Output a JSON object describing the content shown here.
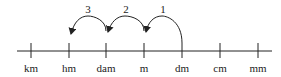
{
  "diagram": {
    "units": [
      {
        "label": "km",
        "x": 31
      },
      {
        "label": "hm",
        "x": 69
      },
      {
        "label": "dam",
        "x": 106
      },
      {
        "label": "m",
        "x": 144
      },
      {
        "label": "dm",
        "x": 182
      },
      {
        "label": "cm",
        "x": 220
      },
      {
        "label": "mm",
        "x": 258
      }
    ],
    "steps": [
      {
        "label": "1",
        "from": "dm",
        "to": "m"
      },
      {
        "label": "2",
        "from": "m",
        "to": "dam"
      },
      {
        "label": "3",
        "from": "dam",
        "to": "hm"
      }
    ],
    "colors": {
      "stroke": "#222222",
      "background": "#ffffff"
    }
  }
}
